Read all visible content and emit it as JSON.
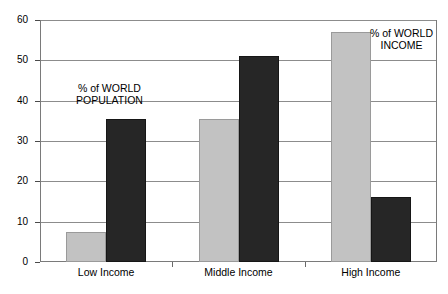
{
  "chart_data": {
    "type": "bar",
    "title": "",
    "subtitle": "",
    "xlabel": "",
    "ylabel": "",
    "categories": [
      "Low Income",
      "Middle Income",
      "High Income"
    ],
    "series": [
      {
        "name": "% of WORLD INCOME",
        "color": "#c2c2c2",
        "values": [
          7.5,
          35.5,
          57
        ]
      },
      {
        "name": "% of WORLD POPULATION",
        "color": "#262626",
        "values": [
          35.5,
          51,
          16
        ]
      }
    ],
    "ylim": [
      0,
      60
    ],
    "yticks": [
      0,
      10,
      20,
      30,
      40,
      50,
      60
    ],
    "ytick_labels": [
      "0",
      "10",
      "20",
      "30",
      "40",
      "50",
      "60"
    ],
    "grid": true,
    "legend_position": "none",
    "annotations": [
      {
        "id": "population",
        "line1": "% of WORLD",
        "line2": "POPULATION"
      },
      {
        "id": "income",
        "line1": "% of WORLD",
        "line2": "INCOME"
      }
    ]
  }
}
